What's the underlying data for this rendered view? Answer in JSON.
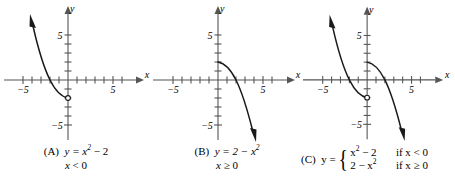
{
  "figure": {
    "type": "multi-panel-graph",
    "panel_count": 3,
    "axis_range": {
      "x": [
        -6.5,
        6.5
      ],
      "y": [
        -6.5,
        6.5
      ]
    },
    "axis_tick_labels": {
      "x": [
        "-5",
        "5"
      ],
      "y": [
        "5",
        "-5"
      ]
    },
    "axis_names": {
      "x": "x",
      "y": "y"
    }
  },
  "panels": [
    {
      "id": "A",
      "tag": "(A)",
      "equation_lead": "y =",
      "equation_base": "x",
      "equation_exp": "2",
      "equation_tail": "− 2",
      "condition_var": "x",
      "condition_rest": "< 0",
      "caption_line1": "(A)  y = x² − 2",
      "caption_line2": "x < 0",
      "curve": {
        "description": "left branch of upward parabola y = x^2 - 2 for x < 0",
        "endpoint_open_circle": [
          0,
          -2
        ],
        "arrow_end": [
          -4.6,
          19
        ],
        "points": [
          [
            0,
            -2
          ],
          [
            -0.5,
            -1.75
          ],
          [
            -1,
            -1
          ],
          [
            -1.5,
            0.25
          ],
          [
            -2,
            2
          ],
          [
            -2.5,
            4.25
          ],
          [
            -3,
            7
          ],
          [
            -3.4,
            9.5
          ]
        ]
      }
    },
    {
      "id": "B",
      "tag": "(B)",
      "equation_lead": "y =",
      "equation_base": "2 − x",
      "equation_exp": "2",
      "condition_var": "x",
      "condition_rest": "≥ 0",
      "caption_line1": "(B)  y = 2 − x²",
      "caption_line2": "x ≥ 0",
      "curve": {
        "description": "right branch of downward parabola y = 2 - x^2 for x >= 0",
        "start_point": [
          0,
          2
        ],
        "arrow_end": [
          3.6,
          -11
        ],
        "points": [
          [
            0,
            2
          ],
          [
            0.5,
            1.75
          ],
          [
            1,
            1
          ],
          [
            1.5,
            -0.25
          ],
          [
            2,
            -2
          ],
          [
            2.5,
            -4.25
          ],
          [
            3,
            -7
          ]
        ]
      }
    },
    {
      "id": "C",
      "tag": "(C)",
      "equation_lead": "y =",
      "rows": [
        {
          "expr_base": "x",
          "expr_exp": "2",
          "expr_tail": "− 2",
          "cond_if": "if",
          "cond_var": "x",
          "cond_rest": "< 0"
        },
        {
          "expr_base": "2 − x",
          "expr_exp": "2",
          "expr_tail": "",
          "cond_if": "if",
          "cond_var": "x",
          "cond_rest": "≥ 0"
        }
      ],
      "caption_text": "(C)  y = { x² − 2  if x < 0 ;  2 − x²  if x ≥ 0 }",
      "curve": {
        "description": "piecewise: left branch of y = x^2 - 2 with open circle at (0,-2), plus right branch of y = 2 - x^2",
        "endpoint_open_circle": [
          0,
          -2
        ],
        "left_points": [
          [
            0,
            -2
          ],
          [
            -0.5,
            -1.75
          ],
          [
            -1,
            -1
          ],
          [
            -1.5,
            0.25
          ],
          [
            -2,
            2
          ],
          [
            -2.5,
            4.25
          ],
          [
            -3,
            7
          ],
          [
            -3.4,
            9.5
          ]
        ],
        "right_points": [
          [
            0,
            2
          ],
          [
            0.5,
            1.75
          ],
          [
            1,
            1
          ],
          [
            1.5,
            -0.25
          ],
          [
            2,
            -2
          ],
          [
            2.5,
            -4.25
          ],
          [
            3,
            -7
          ]
        ]
      }
    }
  ],
  "style": {
    "axis_color": "#555555",
    "curve_color": "#1a1a1a",
    "text_color": "#000000",
    "background": "#ffffff"
  }
}
